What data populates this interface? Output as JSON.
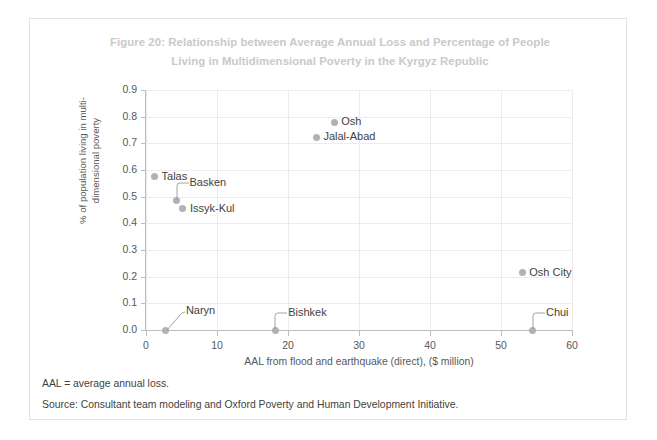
{
  "figure": {
    "title_line1": "Figure 20: Relationship between Average Annual Loss and Percentage of People",
    "title_line2": "Living in Multidimensional Poverty in the Kyrgyz Republic",
    "title_color": "#c9c9c9",
    "frame_border_color": "#e2e2e2",
    "background": "#ffffff"
  },
  "footnotes": {
    "abbreviation": "AAL = average annual loss.",
    "source": "Source: Consultant team modeling and Oxford Poverty and Human Development Initiative."
  },
  "chart_data": {
    "type": "scatter",
    "title": "Figure 20: Relationship between Average Annual Loss and Percentage of People Living in Multidimensional Poverty in the Kyrgyz Republic",
    "xlabel": "AAL from flood and earthquake (direct), ($ million)",
    "ylabel": "% of population living in multi-dimensional poverty",
    "ylabel_line1": "% of population living in multi-",
    "ylabel_line2": "dimensional poverty",
    "xlim": [
      0,
      60
    ],
    "ylim": [
      0.0,
      0.9
    ],
    "xticks": [
      0,
      10,
      20,
      30,
      40,
      50,
      60
    ],
    "xtick_labels": [
      "0",
      "10",
      "20",
      "30",
      "40",
      "50",
      "60"
    ],
    "yticks": [
      0.0,
      0.1,
      0.2,
      0.3,
      0.4,
      0.5,
      0.6,
      0.7,
      0.8,
      0.9
    ],
    "ytick_labels": [
      "0.0",
      "0.1",
      "0.2",
      "0.3",
      "0.4",
      "0.5",
      "0.6",
      "0.7",
      "0.8",
      "0.9"
    ],
    "grid": true,
    "legend": null,
    "marker_color": "#b2b2b2",
    "label_color": "#3f3f41",
    "points": [
      {
        "name": "Osh",
        "x": 26.5,
        "y": 0.78,
        "label_side": "right",
        "leader": "none"
      },
      {
        "name": "Jalal-Abad",
        "x": 24.0,
        "y": 0.722,
        "label_side": "right",
        "leader": "none"
      },
      {
        "name": "Talas",
        "x": 1.2,
        "y": 0.575,
        "label_side": "right",
        "leader": "none"
      },
      {
        "name": "Basken",
        "x": 4.3,
        "y": 0.487,
        "label_side": "above-right",
        "leader": "bracket"
      },
      {
        "name": "Issyk-Kul",
        "x": 5.2,
        "y": 0.455,
        "label_side": "right",
        "leader": "none"
      },
      {
        "name": "Osh City",
        "x": 53.0,
        "y": 0.215,
        "label_side": "right",
        "leader": "none"
      },
      {
        "name": "Naryn",
        "x": 2.8,
        "y": 0.0,
        "label_side": "above-right",
        "leader": "diagonal"
      },
      {
        "name": "Bishkek",
        "x": 18.2,
        "y": 0.0,
        "label_side": "above-right",
        "leader": "bracket"
      },
      {
        "name": "Chui",
        "x": 54.5,
        "y": 0.0,
        "label_side": "above-right",
        "leader": "bracket"
      }
    ]
  }
}
